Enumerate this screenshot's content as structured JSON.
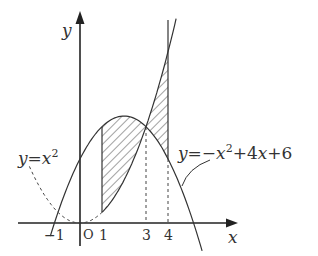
{
  "diagram": {
    "axes": {
      "x_label": "x",
      "y_label": "y",
      "origin_label": "O"
    },
    "ticks": [
      {
        "value": -1,
        "label": "−1"
      },
      {
        "value": 1,
        "label": "1"
      },
      {
        "value": 3,
        "label": "3"
      },
      {
        "value": 4,
        "label": "4"
      }
    ],
    "curves": [
      {
        "name": "parabola-up",
        "equation": "y=x²",
        "label_left": "y",
        "label_eq": "=",
        "label_x": "x",
        "label_exp": "2"
      },
      {
        "name": "parabola-down",
        "equation": "y=−x²+4x+6",
        "label_parts": [
          "y",
          "=",
          "−",
          "x",
          "2",
          "+4",
          "x",
          "+6"
        ]
      }
    ],
    "intersection": {
      "x": 3,
      "y": 9
    },
    "shaded_regions": [
      {
        "from": 1,
        "to": 3,
        "between": [
          "y=−x²+4x+6",
          "y=x²"
        ]
      },
      {
        "from": 3,
        "to": 4,
        "between": [
          "y=x²",
          "y=−x²+4x+6"
        ]
      }
    ],
    "colors": {
      "stroke": "#333333",
      "background": "#ffffff"
    }
  }
}
